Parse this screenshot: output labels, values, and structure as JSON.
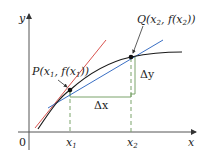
{
  "diagram": {
    "type": "secant-and-tangent-line",
    "axes": {
      "x_label": "x",
      "y_label": "y",
      "origin_label": "0"
    },
    "points": {
      "P": {
        "label_main": "P(x",
        "label_sub": "1",
        "label_mid": ", f(x",
        "label_sub2": "1",
        "label_end": "))"
      },
      "Q": {
        "label_main": "Q(x",
        "label_sub": "2",
        "label_mid": ", f(x",
        "label_sub2": "2",
        "label_end": "))"
      }
    },
    "ticks": {
      "x1": {
        "main": "x",
        "sub": "1"
      },
      "x2": {
        "main": "x",
        "sub": "2"
      }
    },
    "increments": {
      "dx": "Δx",
      "dy": "Δy"
    },
    "colors": {
      "curve": "#1a1a1a",
      "tangent": "#d9534f",
      "secant": "#3a6fc4",
      "bracket": "#6a9a5a",
      "axis": "#444444",
      "dash": "#6a9a5a"
    }
  }
}
